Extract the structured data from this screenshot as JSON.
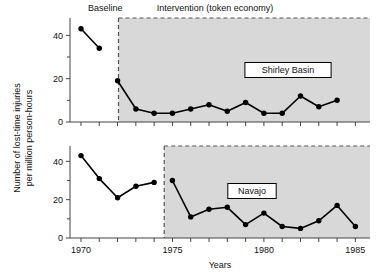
{
  "figure": {
    "phase_labels": {
      "baseline": "Baseline",
      "intervention": "Intervention (token economy)"
    },
    "axis": {
      "ylabel_line1": "Number of lost-time injuries",
      "ylabel_line2": "per million person-hours",
      "xlabel": "Years"
    },
    "colors": {
      "shade": "#d8d8d8",
      "line": "#000000",
      "axis": "#444444",
      "divider": "#555555"
    }
  },
  "chart_data": [
    {
      "type": "line",
      "title": "Shirley Basin",
      "panel": "top",
      "xlabel": "Years",
      "ylabel": "Number of lost-time injuries per million person-hours",
      "xlim": [
        1969.4,
        1985.8
      ],
      "ylim": [
        0,
        48
      ],
      "yticks": [
        0,
        20,
        40
      ],
      "yminorticks": [
        10,
        30
      ],
      "xticks": [
        1970,
        1971,
        1972,
        1973,
        1974,
        1975,
        1976,
        1977,
        1978,
        1979,
        1980,
        1981,
        1982,
        1983,
        1984,
        1985
      ],
      "xticklabels": [
        "1970",
        "",
        "",
        "",
        "",
        "1975",
        "",
        "",
        "",
        "",
        "1980",
        "",
        "",
        "",
        "",
        "1985"
      ],
      "grid": false,
      "legend": "inline-box",
      "phase_divider_x": 1972.05,
      "shaded_from_x": 1972.05,
      "series": [
        {
          "name": "Baseline",
          "x": [
            1970,
            1971
          ],
          "values": [
            43,
            34
          ]
        },
        {
          "name": "Intervention (token economy)",
          "x": [
            1972,
            1973,
            1974,
            1975,
            1976,
            1977,
            1978,
            1979,
            1980,
            1981,
            1982,
            1983,
            1984
          ],
          "values": [
            19,
            6,
            4,
            4,
            6,
            8,
            5,
            9,
            4,
            4,
            12,
            7,
            10
          ]
        }
      ]
    },
    {
      "type": "line",
      "title": "Navajo",
      "panel": "bottom",
      "xlabel": "Years",
      "ylabel": "Number of lost-time injuries per million person-hours",
      "xlim": [
        1969.4,
        1985.8
      ],
      "ylim": [
        0,
        48
      ],
      "yticks": [
        0,
        20,
        40
      ],
      "yminorticks": [
        10,
        30
      ],
      "xticks": [
        1970,
        1971,
        1972,
        1973,
        1974,
        1975,
        1976,
        1977,
        1978,
        1979,
        1980,
        1981,
        1982,
        1983,
        1984,
        1985
      ],
      "xticklabels": [
        "1970",
        "",
        "",
        "",
        "",
        "1975",
        "",
        "",
        "",
        "",
        "1980",
        "",
        "",
        "",
        "",
        "1985"
      ],
      "grid": false,
      "legend": "inline-box",
      "phase_divider_x": 1974.55,
      "shaded_from_x": 1974.55,
      "series": [
        {
          "name": "Baseline",
          "x": [
            1970,
            1971,
            1972,
            1973,
            1974
          ],
          "values": [
            43,
            31,
            21,
            27,
            29
          ]
        },
        {
          "name": "Intervention (token economy)",
          "x": [
            1975,
            1976,
            1977,
            1978,
            1979,
            1980,
            1981,
            1982,
            1983,
            1984,
            1985
          ],
          "values": [
            30,
            11,
            15,
            16,
            7,
            13,
            6,
            5,
            9,
            17,
            6
          ]
        }
      ]
    }
  ]
}
